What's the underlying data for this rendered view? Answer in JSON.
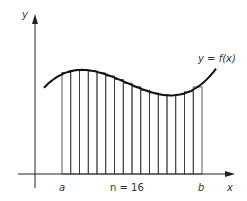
{
  "diagram": {
    "y_axis_label": "y",
    "x_axis_label": "x",
    "curve_label": "y = f(x)",
    "left_bound_label": "a",
    "right_bound_label": "b",
    "n_label": "n = 16",
    "n": 16,
    "x_range": [
      0,
      1
    ],
    "curve_description": "cubic-like curve rising to a maximum near the left, dipping to a minimum near the right, then rising",
    "colors": {
      "line": "#222222",
      "background": "#ffffff"
    }
  }
}
